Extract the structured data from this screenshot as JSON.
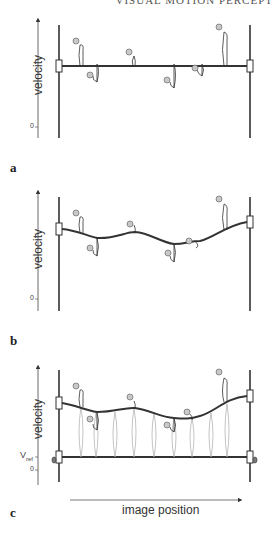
{
  "header": {
    "running_title": "VISUAL MOTION PERCEPT"
  },
  "panels": [
    {
      "letter": "a",
      "ylabel": "velocity",
      "zero_label": "0",
      "description": "rigid horizontal bar between two posts; balls on springs displaced above/below bar"
    },
    {
      "letter": "b",
      "ylabel": "velocity",
      "zero_label": "0",
      "description": "flexible curve deformed by springs toward ball positions"
    },
    {
      "letter": "c",
      "ylabel": "velocity",
      "zero_label": "0",
      "vref_label": "V",
      "vref_sub": "ref",
      "xlabel": "image position",
      "description": "flexible curve with additional springs pulling toward reference velocity line"
    }
  ],
  "colors": {
    "line": "#333333",
    "ball": "#c8c8c8",
    "spring_light": "#aaaaaa"
  }
}
